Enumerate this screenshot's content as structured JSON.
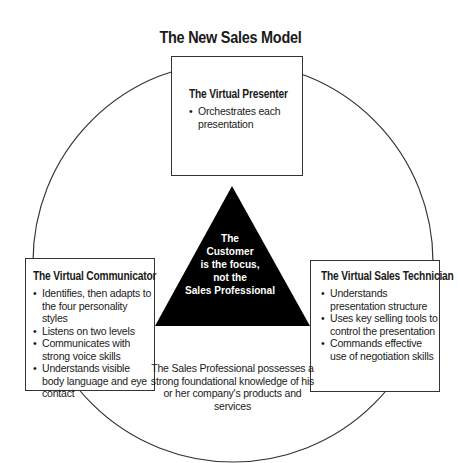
{
  "title": "The New Sales Model",
  "center_triangle": {
    "lines": [
      "The",
      "Customer",
      "is the focus,",
      "not the",
      "Sales Professional"
    ],
    "fill_color": "#000000",
    "text_color": "#ffffff"
  },
  "presenter": {
    "heading": "The Virtual Presenter",
    "bullets": [
      "Orchestrates each presentation"
    ]
  },
  "communicator": {
    "heading": "The Virtual Communicator",
    "bullets": [
      "Identifies, then adapts to the four personality styles",
      "Listens on two levels",
      "Communicates with strong voice skills",
      "Understands visible body language and eye contact"
    ]
  },
  "technician": {
    "heading": "The Virtual Sales Technician",
    "bullets": [
      "Understands presentation structure",
      "Uses key selling tools to control the presentation",
      "Commands effective use of negotiation skills"
    ]
  },
  "foundation_text": "The Sales Professional possesses a strong foundational knowledge of his or her company's products and services",
  "bullet_glyph": "•"
}
